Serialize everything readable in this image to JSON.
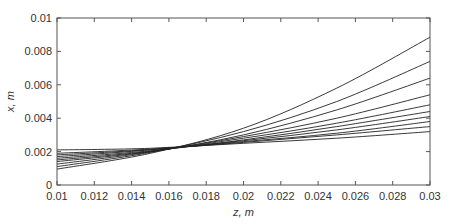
{
  "chart_data": {
    "type": "line",
    "title": "",
    "xlabel": "z, m",
    "ylabel": "x, m",
    "xlim": [
      0.01,
      0.03
    ],
    "ylim": [
      0,
      0.01
    ],
    "xticks": [
      "0.01",
      "0.012",
      "0.014",
      "0.016",
      "0.018",
      "0.02",
      "0.022",
      "0.024",
      "0.026",
      "0.028",
      "0.03"
    ],
    "yticks": [
      "0",
      "0.002",
      "0.004",
      "0.006",
      "0.008",
      "0.01"
    ],
    "grid": false,
    "legend": null,
    "x": [
      0.01,
      0.015,
      0.02,
      0.025,
      0.03
    ],
    "series": [
      {
        "name": "curve-1",
        "values": [
          0.00095,
          0.0019,
          0.0034,
          0.0058,
          0.00885
        ]
      },
      {
        "name": "curve-2",
        "values": [
          0.0011,
          0.00195,
          0.0032,
          0.005,
          0.0074
        ]
      },
      {
        "name": "curve-3",
        "values": [
          0.00125,
          0.00198,
          0.003,
          0.0045,
          0.0064
        ]
      },
      {
        "name": "curve-4",
        "values": [
          0.0014,
          0.002,
          0.0029,
          0.004,
          0.0054
        ]
      },
      {
        "name": "curve-5",
        "values": [
          0.0015,
          0.00202,
          0.0028,
          0.0037,
          0.0048
        ]
      },
      {
        "name": "curve-6",
        "values": [
          0.0016,
          0.00205,
          0.0027,
          0.0035,
          0.0044
        ]
      },
      {
        "name": "curve-7",
        "values": [
          0.0017,
          0.0021,
          0.00265,
          0.0033,
          0.0041
        ]
      },
      {
        "name": "curve-8",
        "values": [
          0.0018,
          0.00212,
          0.0026,
          0.0031,
          0.0038
        ]
      },
      {
        "name": "curve-9",
        "values": [
          0.0019,
          0.00215,
          0.00255,
          0.003,
          0.0035
        ]
      },
      {
        "name": "curve-10",
        "values": [
          0.0021,
          0.0022,
          0.0025,
          0.0028,
          0.0032
        ]
      }
    ]
  },
  "colors": {
    "axis": "#555555",
    "line": "#222222",
    "text": "#333333"
  }
}
